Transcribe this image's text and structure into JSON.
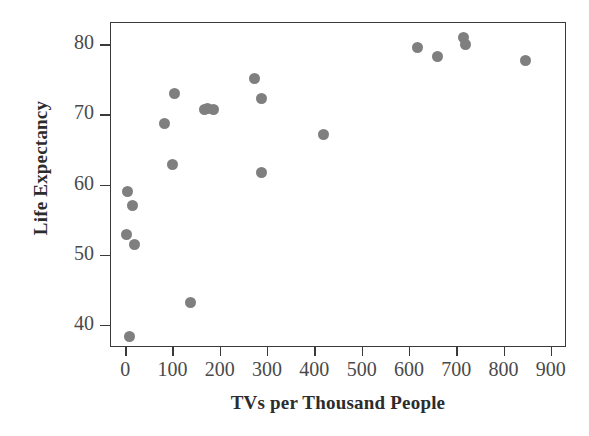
{
  "chart_data": {
    "type": "scatter",
    "title": "",
    "xlabel": "TVs per Thousand People",
    "ylabel": "Life Expectancy",
    "xlim": [
      -32,
      932
    ],
    "ylim": [
      36.8,
      83.2
    ],
    "xticks": [
      0,
      100,
      200,
      300,
      400,
      500,
      600,
      700,
      800,
      900
    ],
    "yticks": [
      40,
      50,
      60,
      70,
      80
    ],
    "xtick_labels": [
      "0",
      "100",
      "200",
      "300",
      "400",
      "500",
      "600",
      "700",
      "800",
      "900"
    ],
    "ytick_labels": [
      "40",
      "50",
      "60",
      "70",
      "80"
    ],
    "grid": false,
    "legend": null,
    "marker_color": "#7f7f7f",
    "marker_size": 11,
    "frame_color": "#3a3a3a",
    "points": [
      {
        "x": 8,
        "y": 38.5
      },
      {
        "x": 1,
        "y": 53.0
      },
      {
        "x": 18,
        "y": 51.6
      },
      {
        "x": 3,
        "y": 59.1
      },
      {
        "x": 14,
        "y": 57.1
      },
      {
        "x": 82,
        "y": 68.9
      },
      {
        "x": 103,
        "y": 73.2
      },
      {
        "x": 99,
        "y": 63.0
      },
      {
        "x": 137,
        "y": 43.3
      },
      {
        "x": 166,
        "y": 70.9
      },
      {
        "x": 172,
        "y": 71.0
      },
      {
        "x": 184,
        "y": 70.8
      },
      {
        "x": 271,
        "y": 75.3
      },
      {
        "x": 286,
        "y": 72.4
      },
      {
        "x": 286,
        "y": 61.8
      },
      {
        "x": 418,
        "y": 67.3
      },
      {
        "x": 616,
        "y": 79.7
      },
      {
        "x": 659,
        "y": 78.4
      },
      {
        "x": 713,
        "y": 81.2
      },
      {
        "x": 717,
        "y": 80.2
      },
      {
        "x": 844,
        "y": 77.9
      }
    ]
  }
}
